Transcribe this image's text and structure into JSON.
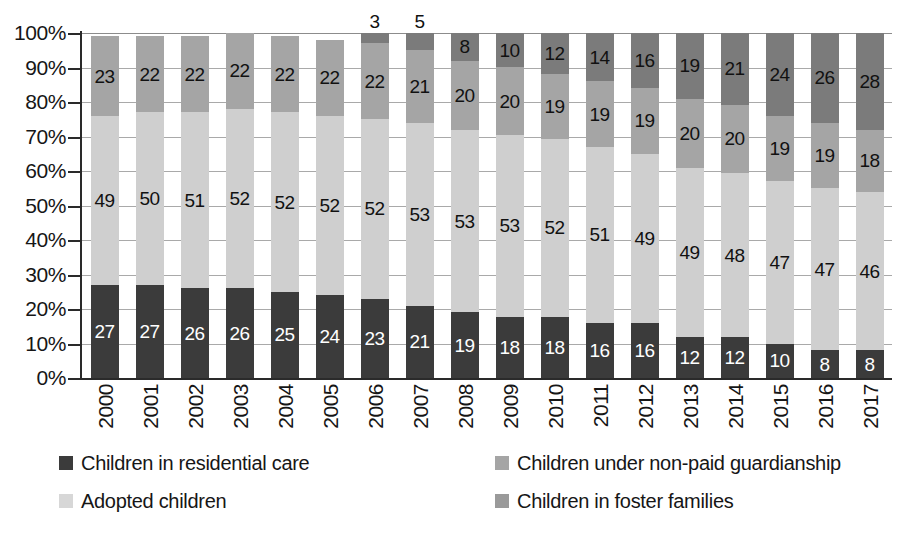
{
  "chart_data": {
    "type": "bar",
    "subtype": "stacked-percentage-column",
    "title": "",
    "subtitle": "",
    "xlabel": "",
    "ylabel": "",
    "ylim": [
      0,
      100
    ],
    "y_unit": "%",
    "grid": true,
    "legend_position": "bottom",
    "categories": [
      "2000",
      "2001",
      "2002",
      "2003",
      "2004",
      "2005",
      "2006",
      "2007",
      "2008",
      "2009",
      "2010",
      "2011",
      "2012",
      "2013",
      "2014",
      "2015",
      "2016",
      "2017"
    ],
    "y_tick_labels": [
      "100%",
      "90%",
      "80%",
      "70%",
      "60%",
      "50%",
      "40%",
      "30%",
      "20%",
      "10%",
      "0%"
    ],
    "y_tick_values": [
      100,
      90,
      80,
      70,
      60,
      50,
      40,
      30,
      20,
      10,
      0
    ],
    "stack_order_bottom_to_top": [
      "residential",
      "adopted",
      "guardianship",
      "foster"
    ],
    "series": [
      {
        "key": "residential",
        "name": "Children in residential care",
        "color": "#3b3b3b",
        "label_color": "#ffffff",
        "values": [
          27,
          27,
          26,
          26,
          25,
          24,
          23,
          21,
          19,
          18,
          18,
          16,
          16,
          12,
          12,
          10,
          8,
          8
        ]
      },
      {
        "key": "adopted",
        "name": "Adopted children",
        "color": "#cfcfcf",
        "label_color": "#111111",
        "values": [
          49,
          50,
          51,
          52,
          52,
          52,
          52,
          53,
          53,
          53,
          52,
          51,
          49,
          49,
          48,
          47,
          47,
          46
        ]
      },
      {
        "key": "guardianship",
        "name": "Children under non-paid guardianship",
        "color": "#a5a5a5",
        "label_color": "#111111",
        "values": [
          23,
          22,
          22,
          22,
          22,
          22,
          22,
          21,
          20,
          20,
          19,
          19,
          19,
          20,
          20,
          19,
          19,
          18
        ]
      },
      {
        "key": "foster",
        "name": "Children in foster families",
        "color": "#7b7b7b",
        "label_color": "#111111",
        "values": [
          null,
          null,
          null,
          null,
          null,
          null,
          3,
          5,
          8,
          10,
          12,
          14,
          16,
          19,
          21,
          24,
          26,
          28
        ]
      }
    ]
  },
  "legend": {
    "items": [
      {
        "label": "Children in residential care",
        "color": "#3b3b3b"
      },
      {
        "label": "Children under non-paid guardianship",
        "color": "#a5a5a5"
      },
      {
        "label": "Adopted children",
        "color": "#d7d7d7"
      },
      {
        "label": "Children in foster families",
        "color": "#9a9a9a"
      }
    ]
  }
}
